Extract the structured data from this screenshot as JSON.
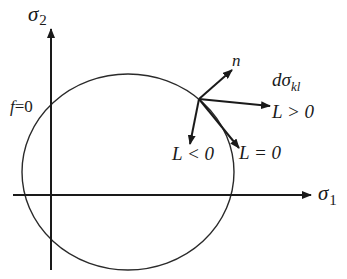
{
  "diagram": {
    "axes": {
      "x_label": "σ",
      "x_subscript": "1",
      "y_label": "σ",
      "y_subscript": "2"
    },
    "yield_surface_label": {
      "f": "f",
      "eq": "=0"
    },
    "vectors": {
      "normal": "n",
      "increment": "dσ",
      "increment_subscript": "kl",
      "loading": "L > 0",
      "neutral": "L = 0",
      "unloading": "L < 0"
    },
    "colors": {
      "stroke": "#1a1a1a",
      "background": "#ffffff"
    }
  }
}
